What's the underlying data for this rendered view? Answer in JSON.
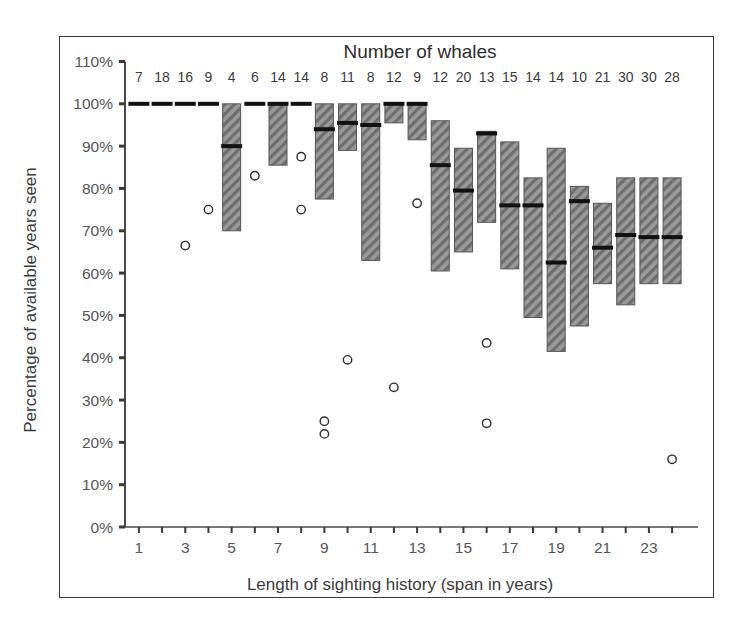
{
  "figure": {
    "background": "#ffffff",
    "border_color": "#3a3a3a"
  },
  "chart_data": {
    "type": "box",
    "title": "Number of whales",
    "xlabel": "Length of  sighting history (span in years)",
    "ylabel": "Percentage of available years seen",
    "x": [
      1,
      2,
      3,
      4,
      5,
      6,
      7,
      8,
      9,
      10,
      11,
      12,
      13,
      14,
      15,
      16,
      17,
      18,
      19,
      20,
      21,
      22,
      23,
      24
    ],
    "xtick_labels": [
      "1",
      "3",
      "5",
      "7",
      "9",
      "11",
      "13",
      "15",
      "17",
      "19",
      "21",
      "23"
    ],
    "xtick_values": [
      1,
      3,
      5,
      7,
      9,
      11,
      13,
      15,
      17,
      19,
      21,
      23
    ],
    "xlim": [
      0.4,
      24.6
    ],
    "ytick_labels": [
      "0%",
      "10%",
      "20%",
      "30%",
      "40%",
      "50%",
      "60%",
      "70%",
      "80%",
      "90%",
      "100%",
      "110%"
    ],
    "ytick_values": [
      0,
      10,
      20,
      30,
      40,
      50,
      60,
      70,
      80,
      90,
      100,
      110
    ],
    "ylim": [
      0,
      110
    ],
    "grid": false,
    "legend": null,
    "top_axis_label": "Number of whales",
    "counts": [
      7,
      18,
      16,
      9,
      4,
      6,
      14,
      14,
      8,
      11,
      8,
      12,
      9,
      12,
      20,
      13,
      15,
      14,
      14,
      10,
      21,
      30,
      30,
      28
    ],
    "box_fill": "#8c8c8c",
    "box_edge": "#555555",
    "median_color": "#111111",
    "hatch": "diagonal",
    "boxes": [
      {
        "x": 1,
        "q1": 100,
        "q3": 100,
        "median": 100
      },
      {
        "x": 2,
        "q1": 100,
        "q3": 100,
        "median": 100
      },
      {
        "x": 3,
        "q1": 100,
        "q3": 100,
        "median": 100
      },
      {
        "x": 4,
        "q1": 100,
        "q3": 100,
        "median": 100
      },
      {
        "x": 5,
        "q1": 70.0,
        "q3": 100,
        "median": 90.0
      },
      {
        "x": 6,
        "q1": 100,
        "q3": 100,
        "median": 100
      },
      {
        "x": 7,
        "q1": 85.5,
        "q3": 100,
        "median": 100
      },
      {
        "x": 8,
        "q1": 100,
        "q3": 100,
        "median": 100
      },
      {
        "x": 9,
        "q1": 77.5,
        "q3": 100,
        "median": 94.0
      },
      {
        "x": 10,
        "q1": 89.0,
        "q3": 100,
        "median": 95.5
      },
      {
        "x": 11,
        "q1": 63.0,
        "q3": 100,
        "median": 95.0
      },
      {
        "x": 12,
        "q1": 95.5,
        "q3": 100,
        "median": 100
      },
      {
        "x": 13,
        "q1": 91.5,
        "q3": 100,
        "median": 100
      },
      {
        "x": 14,
        "q1": 60.5,
        "q3": 96.0,
        "median": 85.5
      },
      {
        "x": 15,
        "q1": 65.0,
        "q3": 89.5,
        "median": 79.5
      },
      {
        "x": 16,
        "q1": 72.0,
        "q3": 93.5,
        "median": 93.0
      },
      {
        "x": 17,
        "q1": 61.0,
        "q3": 91.0,
        "median": 76.0
      },
      {
        "x": 18,
        "q1": 49.5,
        "q3": 82.5,
        "median": 76.0
      },
      {
        "x": 19,
        "q1": 41.5,
        "q3": 89.5,
        "median": 62.5
      },
      {
        "x": 20,
        "q1": 47.5,
        "q3": 80.5,
        "median": 77.0
      },
      {
        "x": 21,
        "q1": 57.5,
        "q3": 76.5,
        "median": 66.0
      },
      {
        "x": 22,
        "q1": 52.5,
        "q3": 82.5,
        "median": 69.0
      },
      {
        "x": 23,
        "q1": 57.5,
        "q3": 82.5,
        "median": 68.5
      },
      {
        "x": 24,
        "q1": 57.5,
        "q3": 82.5,
        "median": 68.5
      }
    ],
    "outliers": [
      {
        "x": 3,
        "y": 66.5
      },
      {
        "x": 4,
        "y": 75.0
      },
      {
        "x": 6,
        "y": 83.0
      },
      {
        "x": 8,
        "y": 87.5
      },
      {
        "x": 8,
        "y": 75.0
      },
      {
        "x": 9,
        "y": 25.0
      },
      {
        "x": 9,
        "y": 22.0
      },
      {
        "x": 10,
        "y": 39.5
      },
      {
        "x": 12,
        "y": 33.0
      },
      {
        "x": 13,
        "y": 76.5
      },
      {
        "x": 16,
        "y": 43.5
      },
      {
        "x": 16,
        "y": 24.5
      },
      {
        "x": 24,
        "y": 16.0
      }
    ]
  }
}
